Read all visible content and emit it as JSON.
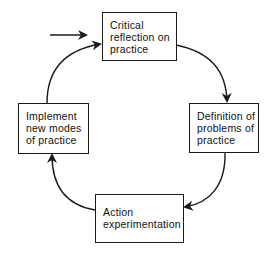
{
  "diagram": {
    "type": "cycle",
    "nodes": [
      {
        "id": "critical",
        "lines": [
          "Critical",
          "reflection on",
          "practice"
        ]
      },
      {
        "id": "definition",
        "lines": [
          "Definition of",
          "problems of",
          "practice"
        ]
      },
      {
        "id": "action",
        "lines": [
          "Action",
          "experimentation"
        ]
      },
      {
        "id": "implement",
        "lines": [
          "Implement",
          "new modes",
          "of practice"
        ]
      }
    ],
    "edges": [
      {
        "from": "entry",
        "to": "critical"
      },
      {
        "from": "critical",
        "to": "definition"
      },
      {
        "from": "definition",
        "to": "action"
      },
      {
        "from": "action",
        "to": "implement"
      },
      {
        "from": "implement",
        "to": "critical"
      }
    ],
    "colors": {
      "stroke": "#1a1a1a",
      "background": "#ffffff"
    }
  }
}
